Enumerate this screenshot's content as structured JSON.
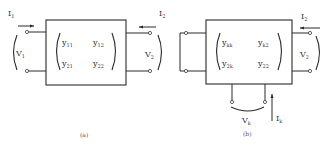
{
  "figure": {
    "panels": [
      {
        "id": "a",
        "caption": "(a)",
        "current_left": {
          "main": "I",
          "sub": "1"
        },
        "current_right": {
          "main": "I",
          "sub": "2"
        },
        "voltage_left": {
          "main": "V",
          "sub": "1"
        },
        "voltage_right": {
          "main": "V",
          "sub": "2"
        },
        "matrix": [
          [
            {
              "main": "y",
              "sub": "11"
            },
            {
              "main": "y",
              "sub": "12"
            }
          ],
          [
            {
              "main": "y",
              "sub": "21"
            },
            {
              "main": "y",
              "sub": "22"
            }
          ]
        ]
      },
      {
        "id": "b",
        "caption": "(b)",
        "current_right": {
          "main": "I",
          "sub": "2"
        },
        "voltage_right": {
          "main": "V",
          "sub": "2"
        },
        "voltage_bottom": {
          "main": "V",
          "sub": "k"
        },
        "current_bottom": {
          "main": "I",
          "sub": "k"
        },
        "matrix": [
          [
            {
              "main": "y",
              "sub": "kk"
            },
            {
              "main": "y",
              "sub": "k2"
            }
          ],
          [
            {
              "main": "y",
              "sub": "2k"
            },
            {
              "main": "y",
              "sub": "22"
            }
          ]
        ]
      }
    ]
  }
}
